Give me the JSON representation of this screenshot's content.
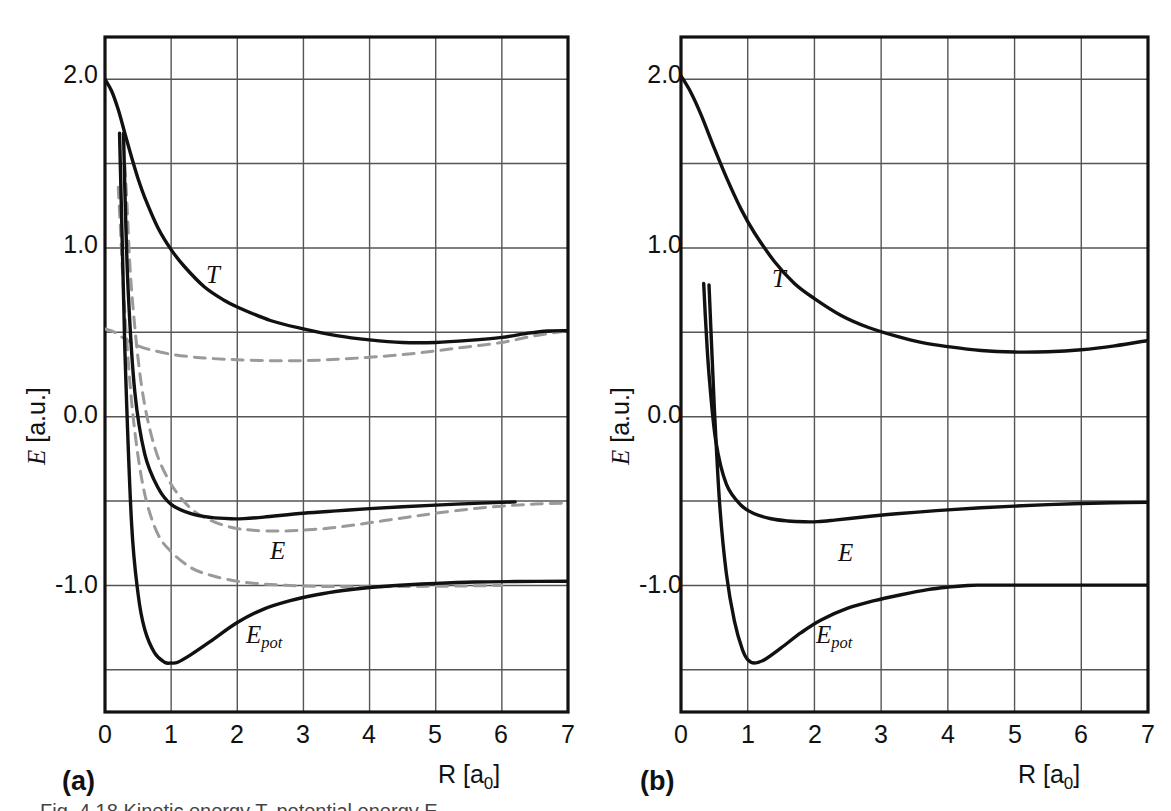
{
  "figure": {
    "background_color": "#ffffff",
    "solid_curve_color": "#111111",
    "dashed_curve_color": "#9a9a9a",
    "frame_color": "#111111",
    "grid_color": "#555555"
  },
  "panels": [
    {
      "letter": "(a)",
      "xlabel": "R [a",
      "xlabel_sub": "0",
      "xlabel_tail": "]",
      "ylabel_italic": "E",
      "ylabel_rest": " [a.u.]",
      "curve_labels": [
        {
          "main": "T",
          "sub": ""
        },
        {
          "main": "E",
          "sub": ""
        },
        {
          "main": "E",
          "sub": "pot"
        }
      ]
    },
    {
      "letter": "(b)",
      "xlabel": "R [a",
      "xlabel_sub": "0",
      "xlabel_tail": "]",
      "ylabel_italic": "E",
      "ylabel_rest": " [a.u.]",
      "curve_labels": [
        {
          "main": "T",
          "sub": ""
        },
        {
          "main": "E",
          "sub": ""
        },
        {
          "main": "E",
          "sub": "pot"
        }
      ]
    }
  ],
  "ticks": {
    "x": [
      "0",
      "1",
      "2",
      "3",
      "4",
      "5",
      "6",
      "7"
    ],
    "y_labeled": [
      "2.0",
      "1.0",
      "0.0",
      "-1.0"
    ]
  },
  "caption_partial": "Fig. 4.18  Kinetic energy T, potential energy E",
  "chart_data": [
    {
      "type": "line",
      "title": "(a)",
      "xlabel": "R [a0]",
      "ylabel": "E [a.u.]",
      "xlim": [
        0,
        7
      ],
      "ylim": [
        -1.75,
        2.25
      ],
      "xticks": [
        0,
        1,
        2,
        3,
        4,
        5,
        6,
        7
      ],
      "yticks": [
        -1.5,
        -1.0,
        -0.5,
        0.0,
        0.5,
        1.0,
        1.5,
        2.0
      ],
      "ytick_labels": {
        "2.0": "2.0",
        "1.0": "1.0",
        "0.0": "0.0",
        "-1.0": "-1.0"
      },
      "grid": true,
      "legend": "inline curve labels",
      "series": [
        {
          "name": "T",
          "style": "solid",
          "color": "#111111",
          "x": [
            0.0,
            0.1,
            0.2,
            0.3,
            0.4,
            0.5,
            0.6,
            0.8,
            1.0,
            1.2,
            1.5,
            1.8,
            2.0,
            2.5,
            3.0,
            3.5,
            4.0,
            4.5,
            5.0,
            5.5,
            6.0,
            6.4,
            6.7,
            7.0
          ],
          "y": [
            2.0,
            1.93,
            1.82,
            1.68,
            1.54,
            1.41,
            1.3,
            1.12,
            0.99,
            0.89,
            0.77,
            0.69,
            0.65,
            0.57,
            0.52,
            0.48,
            0.455,
            0.44,
            0.44,
            0.452,
            0.47,
            0.495,
            0.508,
            0.51
          ]
        },
        {
          "name": "E",
          "style": "solid",
          "color": "#111111",
          "x": [
            0.28,
            0.3,
            0.35,
            0.45,
            0.6,
            0.8,
            1.0,
            1.3,
            1.6,
            1.9,
            2.1,
            2.4,
            3.0,
            3.5,
            4.0,
            4.5,
            5.0,
            5.5,
            6.0,
            6.2
          ],
          "y": [
            1.68,
            1.35,
            0.75,
            0.15,
            -0.22,
            -0.42,
            -0.52,
            -0.575,
            -0.597,
            -0.605,
            -0.604,
            -0.595,
            -0.572,
            -0.558,
            -0.545,
            -0.534,
            -0.524,
            -0.515,
            -0.508,
            -0.505
          ]
        },
        {
          "name": "E_pot",
          "style": "solid",
          "color": "#111111",
          "x": [
            0.22,
            0.25,
            0.3,
            0.4,
            0.5,
            0.6,
            0.75,
            0.9,
            1.0,
            1.1,
            1.3,
            1.6,
            2.0,
            2.4,
            2.8,
            3.2,
            3.6,
            4.0,
            4.4,
            5.0,
            5.6,
            6.2,
            7.0
          ],
          "y": [
            1.68,
            1.2,
            0.4,
            -0.62,
            -1.05,
            -1.26,
            -1.4,
            -1.455,
            -1.46,
            -1.455,
            -1.41,
            -1.33,
            -1.22,
            -1.14,
            -1.09,
            -1.055,
            -1.03,
            -1.012,
            -1.0,
            -0.988,
            -0.98,
            -0.977,
            -0.975
          ]
        },
        {
          "name": "T-dashed",
          "style": "dashed",
          "color": "#9a9a9a",
          "x": [
            0.0,
            0.15,
            0.3,
            0.5,
            0.7,
            1.0,
            1.3,
            1.6,
            2.0,
            2.5,
            3.0,
            3.5,
            4.0,
            4.5,
            5.0,
            5.5,
            6.0,
            6.5,
            7.0
          ],
          "y": [
            0.52,
            0.5,
            0.46,
            0.42,
            0.395,
            0.37,
            0.355,
            0.345,
            0.337,
            0.332,
            0.332,
            0.34,
            0.352,
            0.368,
            0.39,
            0.415,
            0.44,
            0.48,
            0.51
          ]
        },
        {
          "name": "E-dashed",
          "style": "dashed",
          "color": "#9a9a9a",
          "x": [
            0.3,
            0.33,
            0.4,
            0.55,
            0.75,
            1.0,
            1.3,
            1.6,
            1.9,
            2.2,
            2.6,
            3.0,
            3.4,
            3.8,
            4.2,
            4.6,
            5.0,
            5.5,
            6.0,
            6.5,
            7.0
          ],
          "y": [
            1.49,
            1.28,
            0.76,
            0.19,
            -0.18,
            -0.4,
            -0.545,
            -0.615,
            -0.655,
            -0.672,
            -0.678,
            -0.672,
            -0.66,
            -0.64,
            -0.617,
            -0.594,
            -0.572,
            -0.548,
            -0.53,
            -0.518,
            -0.512
          ]
        },
        {
          "name": "Epot-dashed",
          "style": "dashed",
          "color": "#9a9a9a",
          "x": [
            0.2,
            0.23,
            0.3,
            0.42,
            0.58,
            0.78,
            1.0,
            1.3,
            1.6,
            2.0,
            2.4,
            2.8,
            3.2,
            3.6,
            4.0,
            4.5,
            5.0,
            5.5,
            6.0
          ],
          "y": [
            1.36,
            1.14,
            0.62,
            0.02,
            -0.42,
            -0.68,
            -0.8,
            -0.895,
            -0.94,
            -0.975,
            -0.992,
            -1.0,
            -1.005,
            -1.007,
            -1.008,
            -1.006,
            -1.005,
            -1.003,
            -1.0
          ]
        }
      ]
    },
    {
      "type": "line",
      "title": "(b)",
      "xlabel": "R [a0]",
      "ylabel": "E [a.u.]",
      "xlim": [
        0,
        7
      ],
      "ylim": [
        -1.75,
        2.25
      ],
      "xticks": [
        0,
        1,
        2,
        3,
        4,
        5,
        6,
        7
      ],
      "yticks": [
        -1.5,
        -1.0,
        -0.5,
        0.0,
        0.5,
        1.0,
        1.5,
        2.0
      ],
      "ytick_labels": {
        "2.0": "2.0",
        "1.0": "1.0",
        "0.0": "0.0",
        "-1.0": "-1.0"
      },
      "grid": true,
      "legend": "inline curve labels",
      "series": [
        {
          "name": "T",
          "style": "solid",
          "color": "#111111",
          "x": [
            0.0,
            0.15,
            0.3,
            0.5,
            0.7,
            0.9,
            1.1,
            1.4,
            1.7,
            2.0,
            2.4,
            2.8,
            3.2,
            3.6,
            4.0,
            4.5,
            5.0,
            5.5,
            6.0,
            6.5,
            7.0
          ],
          "y": [
            2.02,
            1.92,
            1.79,
            1.59,
            1.4,
            1.23,
            1.09,
            0.92,
            0.79,
            0.7,
            0.6,
            0.53,
            0.48,
            0.44,
            0.415,
            0.392,
            0.383,
            0.385,
            0.397,
            0.42,
            0.452
          ]
        },
        {
          "name": "E",
          "style": "solid",
          "color": "#111111",
          "x": [
            0.34,
            0.37,
            0.42,
            0.52,
            0.68,
            0.9,
            1.1,
            1.35,
            1.6,
            1.85,
            2.05,
            2.3,
            2.7,
            3.1,
            3.5,
            4.0,
            4.5,
            5.0,
            5.5,
            6.0,
            6.5,
            7.0
          ],
          "y": [
            0.79,
            0.56,
            0.25,
            -0.14,
            -0.4,
            -0.525,
            -0.575,
            -0.605,
            -0.618,
            -0.623,
            -0.622,
            -0.613,
            -0.596,
            -0.58,
            -0.567,
            -0.552,
            -0.54,
            -0.53,
            -0.521,
            -0.514,
            -0.51,
            -0.508
          ]
        },
        {
          "name": "E_pot",
          "style": "solid",
          "color": "#111111",
          "x": [
            0.42,
            0.45,
            0.5,
            0.58,
            0.68,
            0.8,
            0.92,
            1.0,
            1.1,
            1.25,
            1.5,
            1.8,
            2.1,
            2.5,
            2.9,
            3.3,
            3.7,
            4.0,
            4.3,
            4.5,
            5.0,
            5.5,
            6.0,
            6.5,
            7.0
          ],
          "y": [
            0.78,
            0.5,
            0.05,
            -0.52,
            -0.93,
            -1.21,
            -1.38,
            -1.44,
            -1.46,
            -1.44,
            -1.37,
            -1.28,
            -1.205,
            -1.135,
            -1.09,
            -1.055,
            -1.025,
            -1.01,
            -1.0,
            -0.998,
            -0.998,
            -0.998,
            -0.998,
            -0.998,
            -0.998
          ]
        }
      ]
    }
  ]
}
